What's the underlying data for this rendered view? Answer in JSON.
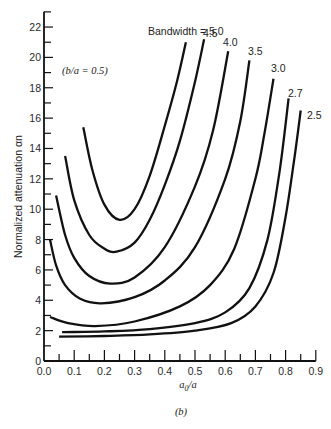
{
  "chart_data": {
    "type": "line",
    "title": "",
    "caption": "(b)",
    "xlabel": "a0/a",
    "ylabel": "Normalized attenuation αn",
    "annotation": "(b/a = 0.5)",
    "legend_prefix": "Bandwidth = ",
    "xlim": [
      0.0,
      0.9
    ],
    "ylim": [
      0,
      23
    ],
    "x_ticks": [
      "0.0",
      "0.1",
      "0.2",
      "0.3",
      "0.4",
      "0.5",
      "0.6",
      "0.7",
      "0.8",
      "0.9"
    ],
    "y_ticks": [
      "0",
      "2",
      "4",
      "6",
      "8",
      "10",
      "12",
      "14",
      "16",
      "18",
      "20",
      "22"
    ],
    "grid": false,
    "legend_position": "curve-end labels (top right)",
    "series": [
      {
        "name": "5.0",
        "points": [
          [
            0.13,
            15.4
          ],
          [
            0.16,
            12.6
          ],
          [
            0.2,
            10.3
          ],
          [
            0.25,
            9.3
          ],
          [
            0.3,
            10.0
          ],
          [
            0.35,
            12.2
          ],
          [
            0.4,
            15.5
          ],
          [
            0.44,
            18.4
          ],
          [
            0.47,
            21.0
          ]
        ]
      },
      {
        "name": "4.5",
        "points": [
          [
            0.07,
            13.5
          ],
          [
            0.1,
            10.6
          ],
          [
            0.15,
            8.3
          ],
          [
            0.2,
            7.4
          ],
          [
            0.24,
            7.2
          ],
          [
            0.3,
            7.8
          ],
          [
            0.35,
            9.3
          ],
          [
            0.4,
            11.6
          ],
          [
            0.45,
            14.5
          ],
          [
            0.5,
            18.4
          ],
          [
            0.53,
            21.2
          ]
        ]
      },
      {
        "name": "4.0",
        "points": [
          [
            0.04,
            10.9
          ],
          [
            0.07,
            8.3
          ],
          [
            0.1,
            6.8
          ],
          [
            0.15,
            5.6
          ],
          [
            0.22,
            5.1
          ],
          [
            0.3,
            5.5
          ],
          [
            0.4,
            7.5
          ],
          [
            0.5,
            11.5
          ],
          [
            0.56,
            15.2
          ],
          [
            0.61,
            20.4
          ]
        ]
      },
      {
        "name": "3.5",
        "points": [
          [
            0.02,
            8.0
          ],
          [
            0.04,
            6.3
          ],
          [
            0.07,
            5.0
          ],
          [
            0.12,
            4.1
          ],
          [
            0.19,
            3.8
          ],
          [
            0.3,
            4.2
          ],
          [
            0.4,
            5.3
          ],
          [
            0.5,
            7.5
          ],
          [
            0.6,
            12.0
          ],
          [
            0.65,
            15.8
          ],
          [
            0.68,
            19.8
          ]
        ]
      },
      {
        "name": "3.0",
        "points": [
          [
            0.02,
            2.9
          ],
          [
            0.08,
            2.5
          ],
          [
            0.17,
            2.3
          ],
          [
            0.3,
            2.6
          ],
          [
            0.45,
            3.6
          ],
          [
            0.55,
            5.0
          ],
          [
            0.63,
            7.4
          ],
          [
            0.7,
            12.0
          ],
          [
            0.73,
            15.0
          ],
          [
            0.76,
            18.6
          ]
        ]
      },
      {
        "name": "2.7",
        "points": [
          [
            0.06,
            1.9
          ],
          [
            0.2,
            1.95
          ],
          [
            0.35,
            2.1
          ],
          [
            0.5,
            2.5
          ],
          [
            0.6,
            3.2
          ],
          [
            0.68,
            4.8
          ],
          [
            0.74,
            8.0
          ],
          [
            0.78,
            12.5
          ],
          [
            0.81,
            17.3
          ]
        ]
      },
      {
        "name": "2.5",
        "points": [
          [
            0.05,
            1.6
          ],
          [
            0.2,
            1.65
          ],
          [
            0.35,
            1.75
          ],
          [
            0.5,
            2.0
          ],
          [
            0.62,
            2.5
          ],
          [
            0.7,
            3.6
          ],
          [
            0.76,
            5.8
          ],
          [
            0.8,
            9.5
          ],
          [
            0.83,
            13.5
          ],
          [
            0.85,
            16.5
          ]
        ]
      }
    ],
    "labels": {
      "bandwidth_prefix": "Bandwidth = 5.0",
      "b45": "4.5",
      "b40": "4.0",
      "b35": "3.5",
      "b30": "3.0",
      "b27": "2.7",
      "b25": "2.5"
    }
  }
}
